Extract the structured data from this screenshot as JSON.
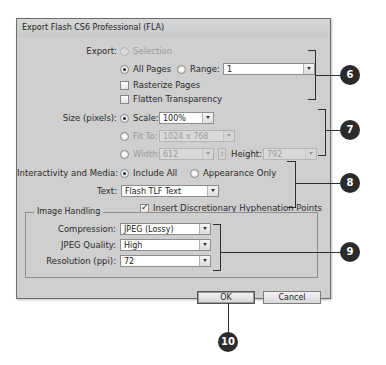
{
  "dialog": {
    "title": "Export Flash CS6 Professional (FLA)",
    "export": {
      "label": "Export:",
      "selection_label": "Selection",
      "all_pages_label": "All Pages",
      "range_label": "Range:",
      "range_value": "1",
      "selected": "All Pages",
      "rasterize_pages_label": "Rasterize Pages",
      "rasterize_pages_checked": false,
      "flatten_transparency_label": "Flatten Transparency",
      "flatten_transparency_checked": false
    },
    "size": {
      "label": "Size (pixels):",
      "scale_label": "Scale:",
      "scale_value": "100%",
      "fit_to_label": "Fit To:",
      "fit_to_value": "1024 x 768",
      "width_label": "Width:",
      "width_value": "612",
      "height_label": "Height:",
      "height_value": "792",
      "selected": "Scale"
    },
    "interactivity": {
      "label": "Interactivity and Media:",
      "include_all_label": "Include All",
      "appearance_only_label": "Appearance Only",
      "selected": "Include All",
      "text_label": "Text:",
      "text_value": "Flash TLF Text",
      "hyphenation_label": "Insert Discretionary Hyphenation Points",
      "hyphenation_checked": true
    },
    "image_handling": {
      "title": "Image Handling",
      "compression_label": "Compression:",
      "compression_value": "JPEG (Lossy)",
      "jpeg_quality_label": "JPEG Quality:",
      "jpeg_quality_value": "High",
      "resolution_label": "Resolution (ppi):",
      "resolution_value": "72"
    },
    "buttons": {
      "ok": "OK",
      "cancel": "Cancel"
    }
  },
  "callouts": [
    "6",
    "7",
    "8",
    "9",
    "10"
  ],
  "colors": {
    "dialog_bg": "#cfcfcf",
    "callout_bg": "#2b2b2b",
    "callout_text": "#ffffff"
  }
}
